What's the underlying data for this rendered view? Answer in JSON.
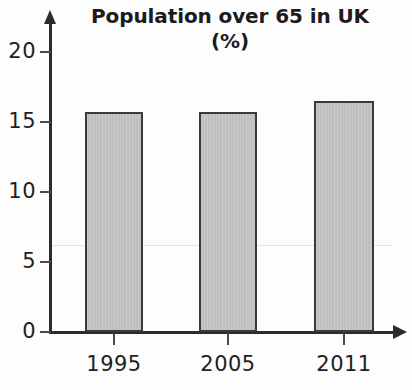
{
  "chart_data": {
    "type": "bar",
    "title": "Population over 65 in UK (%)",
    "title_lines": [
      "Population over 65 in UK",
      "(%)"
    ],
    "xlabel": "",
    "ylabel": "",
    "categories": [
      "1995",
      "2005",
      "2011"
    ],
    "values": [
      15.7,
      15.7,
      16.5
    ],
    "series": [
      {
        "name": "Population over 65 in UK (%)",
        "values": [
          15.7,
          15.7,
          16.5
        ]
      }
    ],
    "ylim": [
      0,
      21.5
    ],
    "yticks": [
      0,
      5,
      10,
      15,
      20
    ],
    "ytick_labels": [
      "0",
      "5",
      "10",
      "15",
      "20"
    ],
    "grid": false,
    "legend": false,
    "legend_position": "none",
    "bar_fill_color": "#c3c3c3",
    "bar_edge_color": "#3a3a3a",
    "axis_color": "#2b2b2b",
    "text_color": "#1f1f1f",
    "background_color": "#fdfdfd"
  }
}
